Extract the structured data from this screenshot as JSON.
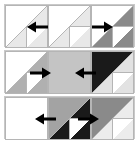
{
  "figure": {
    "width": 139,
    "height": 146,
    "background": "#ffffff",
    "band_border_color": "#c9c9c9",
    "cell_edge_color": "#b5b5b5",
    "palette": {
      "white": "#ffffff",
      "very_light_gray": "#e8e8e8",
      "light_gray": "#d6d6d6",
      "mid_gray": "#c0c0c0",
      "gray": "#a8a8a8",
      "dark_gray": "#6e6e6e",
      "near_black": "#1a1a1a",
      "arrow": "#000000"
    },
    "grid": {
      "rows": 3,
      "cols": 3,
      "cell_size": 43
    },
    "bands": [
      {
        "name": "top-band",
        "top": 4
      },
      {
        "name": "middle-band",
        "top": 50
      },
      {
        "name": "bottom-band",
        "top": 96
      }
    ],
    "cells": [
      {
        "id": "r0c0",
        "name": "cell-row0-col0",
        "x": 5,
        "y": 5,
        "upper_left_fill": "#ffffff",
        "lower_right_fill": "#e8e8e8",
        "inner_triangle_fill": "#ffffff",
        "inner_triangle_present": true,
        "diagonal": "bl-tr"
      },
      {
        "id": "r0c1",
        "name": "cell-row0-col1",
        "x": 48,
        "y": 5,
        "upper_left_fill": "#ffffff",
        "lower_right_fill": "#e8e8e8",
        "inner_triangle_fill": "#ffffff",
        "inner_triangle_present": true,
        "diagonal": "bl-tr"
      },
      {
        "id": "r0c2",
        "name": "cell-row0-col2",
        "x": 91,
        "y": 5,
        "upper_left_fill": "#ffffff",
        "lower_right_fill": "#8a8a8a",
        "inner_triangle_fill": "#ffffff",
        "inner_triangle_present": true,
        "diagonal": "bl-tr"
      },
      {
        "id": "r1c0",
        "name": "cell-row1-col0",
        "x": 5,
        "y": 51,
        "upper_left_fill": "#ffffff",
        "lower_right_fill": "#b0b0b0",
        "inner_triangle_fill": "#ffffff",
        "inner_triangle_present": true,
        "diagonal": "bl-tr"
      },
      {
        "id": "r1c1",
        "name": "cell-row1-col1",
        "x": 48,
        "y": 51,
        "upper_left_fill": "#c4c4c4",
        "lower_right_fill": "#c4c4c4",
        "inner_triangle_fill": "#c4c4c4",
        "inner_triangle_present": false,
        "diagonal": "none"
      },
      {
        "id": "r1c2",
        "name": "cell-row1-col2",
        "x": 91,
        "y": 51,
        "upper_left_fill": "#1a1a1a",
        "lower_right_fill": "#e2e2e2",
        "inner_triangle_fill": "#ffffff",
        "inner_triangle_present": true,
        "diagonal": "bl-tr"
      },
      {
        "id": "r2c0",
        "name": "cell-row2-col0",
        "x": 5,
        "y": 97,
        "upper_left_fill": "#ffffff",
        "lower_right_fill": "#ffffff",
        "inner_triangle_fill": "#ffffff",
        "inner_triangle_present": false,
        "diagonal": "none"
      },
      {
        "id": "r2c1",
        "name": "cell-row2-col1",
        "x": 48,
        "y": 97,
        "upper_left_fill": "#a3a3a3",
        "lower_right_fill": "#1a1a1a",
        "inner_triangle_fill": "#ffffff",
        "inner_triangle_present": true,
        "diagonal": "bl-tr"
      },
      {
        "id": "r2c2",
        "name": "cell-row2-col2",
        "x": 91,
        "y": 97,
        "upper_left_fill": "#8a8a8a",
        "lower_right_fill": "#ececec",
        "inner_triangle_fill": "#ffffff",
        "inner_triangle_present": true,
        "diagonal": "bl-tr"
      }
    ],
    "arrows": [
      {
        "id": "a0",
        "name": "arrow-left-row0-col0",
        "direction": "left",
        "x": 26,
        "y": 21
      },
      {
        "id": "a1",
        "name": "arrow-right-row0-col2",
        "direction": "right",
        "x": 92,
        "y": 21
      },
      {
        "id": "a2",
        "name": "arrow-right-row1-col0",
        "direction": "right",
        "x": 30,
        "y": 67
      },
      {
        "id": "a3",
        "name": "arrow-left-row1-col2",
        "direction": "left",
        "x": 74,
        "y": 67
      },
      {
        "id": "a4",
        "name": "arrow-left-row2-col1",
        "direction": "left",
        "x": 34,
        "y": 113
      },
      {
        "id": "a5",
        "name": "arrow-right-row2-col2",
        "direction": "right",
        "x": 78,
        "y": 113
      }
    ]
  }
}
